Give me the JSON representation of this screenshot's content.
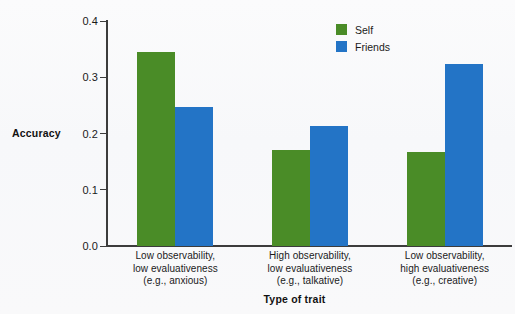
{
  "chart_data": {
    "type": "bar",
    "title": "",
    "xlabel": "Type of trait",
    "ylabel": "Accuracy",
    "ylim": [
      0.0,
      0.4
    ],
    "yticks": [
      "0.0",
      "0.1",
      "0.2",
      "0.3",
      "0.4"
    ],
    "ytick_values": [
      0.0,
      0.1,
      0.2,
      0.3,
      0.4
    ],
    "grid": false,
    "legend_position": "top-right",
    "categories": [
      "Low observability,\nlow evaluativeness\n(e.g., anxious)",
      "High observability,\nlow evaluativeness\n(e.g., talkative)",
      "Low observability,\nhigh evaluativeness\n(e.g., creative)"
    ],
    "category_lines": [
      [
        "Low observability,",
        "low evaluativeness",
        "(e.g., anxious)"
      ],
      [
        "High observability,",
        "low evaluativeness",
        "(e.g., talkative)"
      ],
      [
        "Low observability,",
        "high evaluativeness",
        "(e.g., creative)"
      ]
    ],
    "series": [
      {
        "name": "Self",
        "color": "#4a8c27",
        "values": [
          0.345,
          0.171,
          0.167
        ]
      },
      {
        "name": "Friends",
        "color": "#2374c6",
        "values": [
          0.247,
          0.213,
          0.324
        ]
      }
    ]
  },
  "legend": {
    "items": [
      {
        "label": "Self",
        "color": "#4a8c27"
      },
      {
        "label": "Friends",
        "color": "#2374c6"
      }
    ]
  },
  "axes": {
    "y_title": "Accuracy",
    "x_title": "Type of trait"
  },
  "colors": {
    "self": "#4a8c27",
    "friends": "#2374c6",
    "axis": "#3c3c3c",
    "text": "#1a1a1a",
    "background": "#f8f9fa"
  }
}
